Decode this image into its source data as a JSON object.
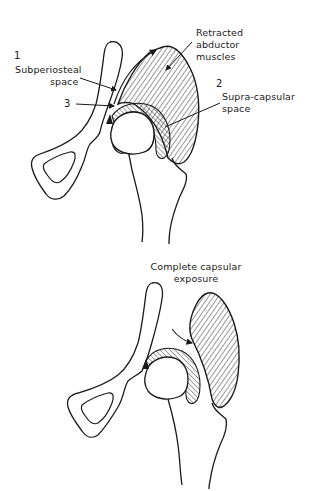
{
  "figures": [
    {
      "id": "top",
      "description": "Hip joint with abductor muscles retracted, showing surgical spaces",
      "labels": {
        "num1": "1",
        "subperiosteal_line1": "Subperiosteal",
        "subperiosteal_line2": "space",
        "num3": "3",
        "retracted_line1": "Retracted",
        "retracted_line2": "abductor",
        "retracted_line3": "muscles",
        "num2": "2",
        "supracapsular_line1": "Supra-capsular",
        "supracapsular_line2": "space"
      }
    },
    {
      "id": "bottom",
      "description": "Hip joint with complete capsular exposure",
      "labels": {
        "complete_line1": "Complete capsular",
        "complete_line2": "exposure"
      }
    }
  ],
  "colors": {
    "ink": "#1a1a1a",
    "background": "#ffffff"
  }
}
